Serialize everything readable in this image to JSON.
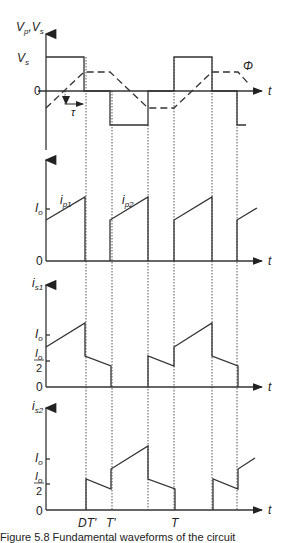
{
  "figure": {
    "panels": [
      {
        "id": "voltage",
        "y_label": "V_p, V_s",
        "y_label_main": "V",
        "y_label_sub1": "p",
        "y_label_sep": ",",
        "y_label_main2": "V",
        "y_label_sub2": "s",
        "ticks": [
          "V_s",
          "0"
        ],
        "tick_vs_main": "V",
        "tick_vs_sub": "s",
        "tick_zero": "0",
        "x_label": "t",
        "annotations": {
          "phi": "Φ",
          "tau": "τ"
        }
      },
      {
        "id": "primary-current",
        "y_label": "",
        "ticks": [
          "I_o",
          "0"
        ],
        "tick_io_main": "I",
        "tick_io_sub": "o",
        "tick_zero": "0",
        "x_label": "t",
        "curve_labels": {
          "ip1_main": "i",
          "ip1_sub": "p1",
          "ip2_main": "i",
          "ip2_sub": "p2"
        }
      },
      {
        "id": "switch1-current",
        "y_label_main": "i",
        "y_label_sub": "s1",
        "tick_io_main": "I",
        "tick_io_sub": "o",
        "tick_half_main": "I",
        "tick_half_sub": "o",
        "tick_half_den": "2",
        "tick_zero": "0",
        "x_label": "t"
      },
      {
        "id": "switch2-current",
        "y_label_main": "i",
        "y_label_sub": "s2",
        "tick_io_main": "I",
        "tick_io_sub": "o",
        "tick_half_main": "I",
        "tick_half_sub": "o",
        "tick_half_den": "2",
        "tick_zero": "0",
        "x_label": "t"
      }
    ],
    "time_marks": {
      "dt_prime": "DT'",
      "t_prime": "T'",
      "t": "T"
    },
    "caption": "Figure 5.8  Fundamental waveforms of the circuit"
  }
}
